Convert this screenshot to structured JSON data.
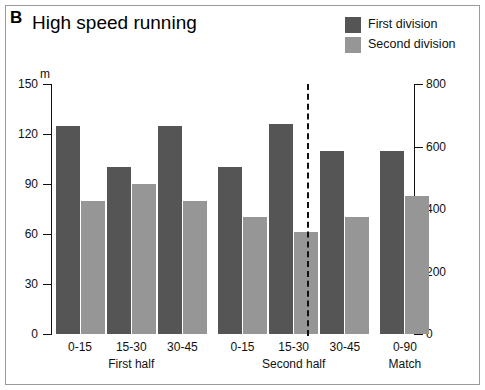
{
  "panel": {
    "letter": "B",
    "title": "High speed running"
  },
  "legend": {
    "items": [
      {
        "label": "First division",
        "color": "#555555",
        "name": "legend-first-division"
      },
      {
        "label": "Second division",
        "color": "#969696",
        "name": "legend-second-division"
      }
    ]
  },
  "axes": {
    "left_unit": "m",
    "left_ticks": [
      "0",
      "30",
      "60",
      "90",
      "120",
      "150"
    ],
    "right_ticks": [
      "0",
      "200",
      "400",
      "600",
      "800"
    ]
  },
  "chart_data": {
    "type": "bar",
    "title": "High speed running",
    "panel_label": "B",
    "xlabel": "",
    "ylabel": "m",
    "ylim": [
      0,
      150
    ],
    "y2lim": [
      0,
      800
    ],
    "grid": false,
    "legend_position": "top-right",
    "categories": [
      "0-15",
      "15-30",
      "30-45",
      "0-15",
      "15-30",
      "30-45",
      "0-90"
    ],
    "group_labels": [
      "First half",
      "Second half",
      "Match"
    ],
    "groups": [
      {
        "label": "First half",
        "categories": [
          "0-15",
          "15-30",
          "30-45"
        ]
      },
      {
        "label": "Second half",
        "categories": [
          "0-15",
          "15-30",
          "30-45"
        ]
      },
      {
        "label": "Match",
        "categories": [
          "0-90"
        ]
      }
    ],
    "series": [
      {
        "name": "First division",
        "color": "#555555",
        "values": [
          125,
          100,
          125,
          100,
          126,
          110,
          110
        ]
      },
      {
        "name": "Second division",
        "color": "#969696",
        "values": [
          80,
          90,
          80,
          70,
          61,
          70,
          83
        ]
      }
    ]
  }
}
